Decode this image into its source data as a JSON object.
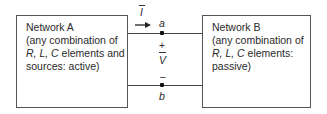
{
  "network_a": {
    "title": "Network A",
    "line1": "(any combination of",
    "line2_italic": "R, L, C",
    "line2_rest": " elements and",
    "line3": "sources: active)"
  },
  "network_b": {
    "title": "Network B",
    "line1": "(any combination of",
    "line2_italic": "R, L, C",
    "line2_rest": " elements:",
    "line3": "passive)"
  },
  "terminals": {
    "a": "a",
    "b": "b"
  },
  "voltage": {
    "symbol": "V",
    "plus": "+",
    "minus": "–"
  },
  "current": {
    "symbol": "I"
  },
  "colors": {
    "line": "#444444",
    "text": "#2a2a2a"
  }
}
